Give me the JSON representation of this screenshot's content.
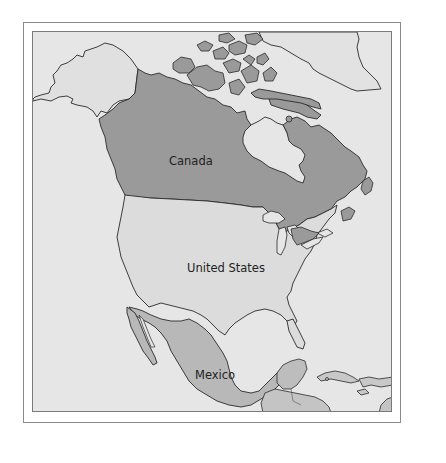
{
  "map": {
    "title": "",
    "colors": {
      "ocean": "#e6e6e6",
      "canada": "#9a9a9a",
      "united_states": "#dcdcdc",
      "mexico": "#b8b8b8",
      "central_america": "#bdbdbd",
      "caribbean": "#c8c8c8",
      "greenland": "#e2e2e2",
      "alaska": "#e0e0e0",
      "outline": "#2a2a2a"
    },
    "labels": [
      {
        "id": "canada",
        "text": "Canada",
        "x": 168,
        "y": 155
      },
      {
        "id": "united_states",
        "text": "United States",
        "x": 186,
        "y": 262
      },
      {
        "id": "mexico",
        "text": "Mexico",
        "x": 194,
        "y": 368
      }
    ]
  }
}
